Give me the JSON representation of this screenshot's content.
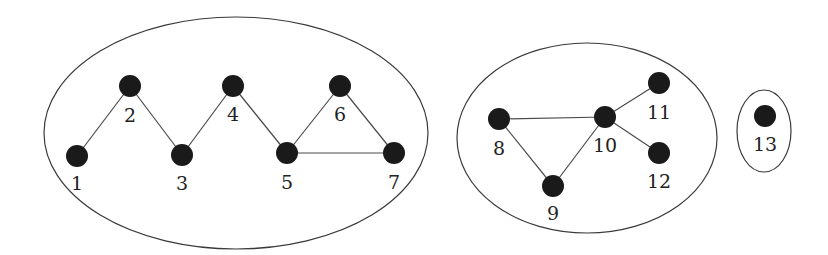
{
  "diagram": {
    "type": "graph-connected-components",
    "colors": {
      "node": "#1a1a1a",
      "edge": "#4a4a4a",
      "cluster": "#3a3a3a",
      "label": "#222222",
      "background": "#ffffff"
    },
    "node_radius": 11,
    "clusters": [
      {
        "id": "component-1",
        "cx": 236,
        "cy": 133,
        "rx": 192,
        "ry": 116,
        "members": [
          "1",
          "2",
          "3",
          "4",
          "5",
          "6",
          "7"
        ]
      },
      {
        "id": "component-2",
        "cx": 587,
        "cy": 138,
        "rx": 130,
        "ry": 95,
        "members": [
          "8",
          "9",
          "10",
          "11",
          "12"
        ]
      },
      {
        "id": "component-3",
        "cx": 764,
        "cy": 131,
        "rx": 27,
        "ry": 41,
        "members": [
          "13"
        ]
      }
    ],
    "nodes": [
      {
        "id": "1",
        "label": "1",
        "x": 77,
        "y": 156,
        "lx": 77,
        "ly": 185
      },
      {
        "id": "2",
        "label": "2",
        "x": 130,
        "y": 86,
        "lx": 130,
        "ly": 117
      },
      {
        "id": "3",
        "label": "3",
        "x": 182,
        "y": 155,
        "lx": 182,
        "ly": 185
      },
      {
        "id": "4",
        "label": "4",
        "x": 233,
        "y": 86,
        "lx": 233,
        "ly": 116
      },
      {
        "id": "5",
        "label": "5",
        "x": 287,
        "y": 153,
        "lx": 287,
        "ly": 184
      },
      {
        "id": "6",
        "label": "6",
        "x": 340,
        "y": 86,
        "lx": 340,
        "ly": 116
      },
      {
        "id": "7",
        "label": "7",
        "x": 394,
        "y": 153,
        "lx": 394,
        "ly": 184
      },
      {
        "id": "8",
        "label": "8",
        "x": 499,
        "y": 119,
        "lx": 499,
        "ly": 150
      },
      {
        "id": "9",
        "label": "9",
        "x": 553,
        "y": 186,
        "lx": 553,
        "ly": 215
      },
      {
        "id": "10",
        "label": "10",
        "x": 605,
        "y": 117,
        "lx": 605,
        "ly": 147
      },
      {
        "id": "11",
        "label": "11",
        "x": 659,
        "y": 83,
        "lx": 659,
        "ly": 114
      },
      {
        "id": "12",
        "label": "12",
        "x": 659,
        "y": 153,
        "lx": 659,
        "ly": 183
      },
      {
        "id": "13",
        "label": "13",
        "x": 765,
        "y": 116,
        "lx": 765,
        "ly": 146
      }
    ],
    "edges": [
      [
        "1",
        "2"
      ],
      [
        "2",
        "3"
      ],
      [
        "3",
        "4"
      ],
      [
        "4",
        "5"
      ],
      [
        "5",
        "6"
      ],
      [
        "6",
        "7"
      ],
      [
        "5",
        "7"
      ],
      [
        "8",
        "10"
      ],
      [
        "8",
        "9"
      ],
      [
        "9",
        "10"
      ],
      [
        "10",
        "11"
      ],
      [
        "10",
        "12"
      ]
    ]
  }
}
